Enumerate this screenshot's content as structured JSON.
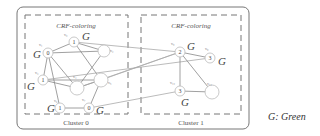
{
  "diagram": {
    "clusters": [
      {
        "label": "Cluster 0",
        "title": "CRF-coloring",
        "nodes": [
          {
            "id": "v0",
            "name": "v₁",
            "value": "0",
            "color": "G",
            "x": 48,
            "y": 53
          },
          {
            "id": "v1",
            "name": "v₀",
            "value": "1",
            "color": "G",
            "x": 74,
            "y": 42
          },
          {
            "id": "v2",
            "name": "v₂",
            "value": "",
            "color": "",
            "x": 104,
            "y": 51
          },
          {
            "id": "v3",
            "name": "v₃",
            "value": "1",
            "color": "G",
            "x": 43,
            "y": 80
          },
          {
            "id": "v4",
            "name": "v₄",
            "value": "",
            "color": "",
            "x": 77,
            "y": 88
          },
          {
            "id": "v5",
            "name": "v₅",
            "value": "",
            "color": "",
            "x": 101,
            "y": 80
          },
          {
            "id": "v6",
            "name": "v₆",
            "value": "1",
            "color": "G",
            "x": 60,
            "y": 108
          },
          {
            "id": "v7",
            "name": "v₇",
            "value": "0",
            "color": "G",
            "x": 89,
            "y": 108
          }
        ]
      },
      {
        "label": "Cluster 1",
        "title": "CRF-coloring",
        "nodes": [
          {
            "id": "v8",
            "name": "v₈",
            "value": "2",
            "color": "G",
            "x": 180,
            "y": 52
          },
          {
            "id": "v9",
            "name": "v₉",
            "value": "3",
            "color": "G",
            "x": 210,
            "y": 58
          },
          {
            "id": "v10",
            "name": "v₁₀",
            "value": "3",
            "color": "G",
            "x": 180,
            "y": 91
          },
          {
            "id": "v11",
            "name": "v₁₁",
            "value": "",
            "color": "",
            "x": 212,
            "y": 92
          }
        ]
      }
    ],
    "legend": "G: Green"
  }
}
